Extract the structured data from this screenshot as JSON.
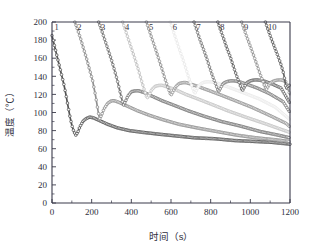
{
  "figure": {
    "background": "#ffffff",
    "axis_color": "#3a3a4a"
  },
  "chart_data": {
    "type": "line",
    "title": "",
    "xlabel": "时间（s）",
    "ylabel": "温度（℃）",
    "xlim": [
      0,
      1200
    ],
    "ylim": [
      0,
      200
    ],
    "xticks": [
      0,
      200,
      400,
      600,
      800,
      1000,
      1200
    ],
    "xtick_labels": [
      "0",
      "200",
      "400",
      "600",
      "800",
      "1000",
      "1200"
    ],
    "yticks": [
      0,
      20,
      40,
      60,
      80,
      100,
      120,
      140,
      160,
      180,
      200
    ],
    "ytick_labels": [
      "0",
      "20",
      "40",
      "60",
      "80",
      "100",
      "120",
      "140",
      "160",
      "180",
      "200"
    ],
    "grid": false,
    "legend": "inline-curve-labels-top",
    "marker": "open-circle",
    "annotations": [
      "1",
      "2",
      "3",
      "4",
      "5",
      "6",
      "7",
      "8",
      "9",
      "10"
    ],
    "series": [
      {
        "name": "1",
        "label": "1",
        "color": "#4a4a4a",
        "quench_time": 120,
        "min_temp": 75,
        "rebound_peak_temp": 95,
        "rebound_peak_time": 190,
        "end_temp": 65,
        "x": [
          0,
          10,
          20,
          30,
          40,
          50,
          60,
          70,
          80,
          90,
          100,
          110,
          120,
          130,
          140,
          155,
          170,
          190,
          210,
          240,
          280,
          330,
          390,
          460,
          540,
          630,
          720,
          820,
          920,
          1020,
          1110,
          1200
        ],
        "y": [
          185,
          176,
          167,
          158,
          149,
          140,
          131,
          120,
          108,
          96,
          86,
          79,
          75,
          78,
          84,
          90,
          93,
          95,
          94,
          91,
          87,
          83,
          80,
          78,
          76,
          74,
          72,
          71,
          69,
          68,
          67,
          65
        ]
      },
      {
        "name": "2",
        "label": "2",
        "color": "#8a8a8a",
        "quench_time": 240,
        "min_temp": 93,
        "rebound_peak_temp": 113,
        "rebound_peak_time": 310,
        "end_temp": 68,
        "x": [
          115,
          130,
          145,
          160,
          175,
          190,
          205,
          220,
          232,
          240,
          250,
          262,
          280,
          300,
          315,
          340,
          380,
          430,
          490,
          560,
          640,
          730,
          830,
          930,
          1030,
          1120,
          1200
        ],
        "y": [
          200,
          191,
          181,
          170,
          159,
          147,
          135,
          118,
          102,
          93,
          97,
          104,
          110,
          113,
          113,
          111,
          107,
          102,
          97,
          92,
          87,
          83,
          79,
          75,
          72,
          70,
          68
        ]
      },
      {
        "name": "3",
        "label": "3",
        "color": "#6e6e6e",
        "quench_time": 360,
        "min_temp": 108,
        "rebound_peak_temp": 124,
        "rebound_peak_time": 430,
        "end_temp": 72,
        "x": [
          235,
          250,
          265,
          282,
          300,
          315,
          330,
          344,
          355,
          360,
          370,
          382,
          400,
          420,
          437,
          465,
          505,
          555,
          615,
          685,
          765,
          855,
          950,
          1050,
          1140,
          1200
        ],
        "y": [
          200,
          191,
          181,
          170,
          158,
          147,
          135,
          122,
          112,
          108,
          112,
          118,
          123,
          124,
          124,
          122,
          118,
          113,
          108,
          102,
          96,
          90,
          85,
          79,
          75,
          72
        ]
      },
      {
        "name": "4",
        "label": "4",
        "color": "#c0c0c0",
        "quench_time": 480,
        "min_temp": 116,
        "rebound_peak_temp": 130,
        "rebound_peak_time": 550,
        "end_temp": 78,
        "x": [
          356,
          370,
          385,
          402,
          420,
          436,
          450,
          464,
          474,
          480,
          490,
          502,
          520,
          540,
          557,
          585,
          625,
          675,
          735,
          805,
          885,
          975,
          1070,
          1160,
          1200
        ],
        "y": [
          200,
          191,
          181,
          170,
          158,
          147,
          136,
          126,
          119,
          116,
          119,
          125,
          129,
          130,
          130,
          128,
          125,
          120,
          115,
          109,
          102,
          95,
          88,
          81,
          78
        ]
      },
      {
        "name": "5",
        "label": "5",
        "color": "#8f8f8f",
        "quench_time": 600,
        "min_temp": 119,
        "rebound_peak_temp": 133,
        "rebound_peak_time": 670,
        "end_temp": 84,
        "x": [
          476,
          490,
          505,
          522,
          540,
          556,
          570,
          584,
          594,
          600,
          610,
          622,
          640,
          660,
          677,
          705,
          745,
          795,
          855,
          925,
          1005,
          1095,
          1180,
          1200
        ],
        "y": [
          200,
          191,
          181,
          170,
          158,
          147,
          137,
          128,
          122,
          119,
          123,
          128,
          132,
          133,
          133,
          131,
          128,
          124,
          119,
          113,
          106,
          97,
          88,
          84
        ]
      },
      {
        "name": "6",
        "label": "6",
        "color": "#eaeaea",
        "quench_time": 720,
        "min_temp": 121,
        "rebound_peak_temp": 134,
        "rebound_peak_time": 790,
        "end_temp": 92,
        "x": [
          596,
          610,
          625,
          642,
          660,
          676,
          690,
          704,
          714,
          720,
          730,
          742,
          760,
          780,
          797,
          825,
          865,
          915,
          975,
          1045,
          1125,
          1200
        ],
        "y": [
          200,
          191,
          181,
          170,
          159,
          148,
          138,
          130,
          124,
          121,
          125,
          130,
          133,
          134,
          134,
          133,
          130,
          126,
          121,
          115,
          106,
          92
        ]
      },
      {
        "name": "7",
        "label": "7",
        "color": "#767676",
        "quench_time": 840,
        "min_temp": 123,
        "rebound_peak_temp": 135,
        "rebound_peak_time": 910,
        "end_temp": 100,
        "x": [
          716,
          730,
          745,
          762,
          780,
          796,
          810,
          824,
          834,
          840,
          850,
          862,
          880,
          900,
          917,
          945,
          985,
          1035,
          1095,
          1165,
          1200
        ],
        "y": [
          200,
          191,
          181,
          171,
          160,
          149,
          140,
          132,
          126,
          123,
          127,
          132,
          134,
          135,
          135,
          134,
          131,
          127,
          121,
          112,
          100
        ]
      },
      {
        "name": "8",
        "label": "8",
        "color": "#5e5e5e",
        "quench_time": 960,
        "min_temp": 124,
        "rebound_peak_temp": 136,
        "rebound_peak_time": 1030,
        "end_temp": 110,
        "x": [
          836,
          850,
          865,
          882,
          900,
          916,
          930,
          944,
          954,
          960,
          970,
          982,
          1000,
          1020,
          1037,
          1065,
          1105,
          1155,
          1200
        ],
        "y": [
          200,
          191,
          182,
          171,
          161,
          150,
          141,
          133,
          127,
          124,
          128,
          133,
          135,
          136,
          136,
          135,
          132,
          127,
          110
        ]
      },
      {
        "name": "9",
        "label": "9",
        "color": "#909090",
        "quench_time": 1080,
        "min_temp": 125,
        "rebound_peak_temp": 136,
        "rebound_peak_time": 1150,
        "end_temp": 119,
        "x": [
          956,
          970,
          985,
          1002,
          1020,
          1036,
          1050,
          1064,
          1074,
          1080,
          1090,
          1102,
          1120,
          1140,
          1157,
          1180,
          1200
        ],
        "y": [
          200,
          191,
          182,
          172,
          161,
          151,
          142,
          134,
          128,
          125,
          129,
          133,
          135,
          136,
          136,
          134,
          119
        ]
      },
      {
        "name": "10",
        "label": "10",
        "color": "#5a5a5a",
        "quench_time": 1180,
        "min_temp": 126,
        "rebound_peak_temp": 132,
        "rebound_peak_time": 1200,
        "end_temp": 130,
        "x": [
          1076,
          1090,
          1105,
          1122,
          1140,
          1156,
          1168,
          1176,
          1180,
          1186,
          1194,
          1200
        ],
        "y": [
          200,
          191,
          182,
          172,
          162,
          152,
          143,
          133,
          126,
          128,
          130,
          130
        ]
      }
    ]
  }
}
